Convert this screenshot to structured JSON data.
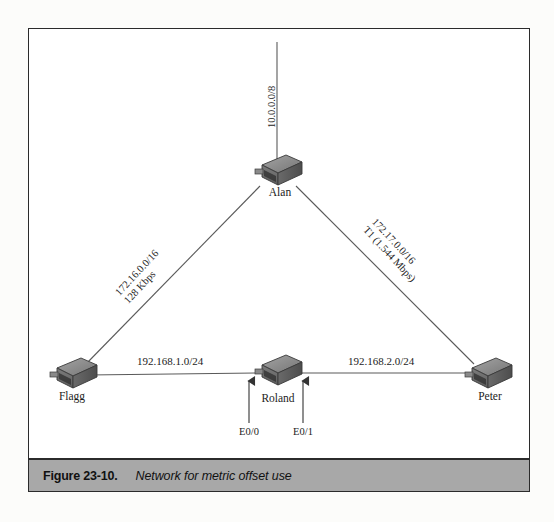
{
  "figure": {
    "caption_number": "Figure 23-10.",
    "caption_text": "Network for metric offset use"
  },
  "diagram": {
    "type": "network-topology",
    "nodes": [
      {
        "id": "alan",
        "label": "Alan",
        "role": "router",
        "x": 277,
        "y": 172
      },
      {
        "id": "flagg",
        "label": "Flagg",
        "role": "router",
        "x": 72,
        "y": 375
      },
      {
        "id": "roland",
        "label": "Roland",
        "role": "router",
        "x": 277,
        "y": 375
      },
      {
        "id": "peter",
        "label": "Peter",
        "role": "router",
        "x": 487,
        "y": 375
      }
    ],
    "links": [
      {
        "id": "alan-cloud",
        "from": "alan",
        "to": "external",
        "network": "10.0.0.0/8",
        "speed": "",
        "orientation": "vertical"
      },
      {
        "id": "alan-flagg",
        "from": "alan",
        "to": "flagg",
        "network": "172.16.0.0/16",
        "speed": "128 Kbps",
        "orientation": "diagonal-left"
      },
      {
        "id": "alan-peter",
        "from": "alan",
        "to": "peter",
        "network": "172.17.0.0/16",
        "speed": "T1 (1.544 Mbps)",
        "orientation": "diagonal-right"
      },
      {
        "id": "flagg-roland",
        "from": "flagg",
        "to": "roland",
        "network": "192.168.1.0/24",
        "speed": "",
        "orientation": "horizontal"
      },
      {
        "id": "roland-peter",
        "from": "roland",
        "to": "peter",
        "network": "192.168.2.0/24",
        "speed": "",
        "orientation": "horizontal"
      }
    ],
    "interfaces": [
      {
        "id": "e0-0",
        "label": "E0/0",
        "node": "roland",
        "side": "left"
      },
      {
        "id": "e0-1",
        "label": "E0/1",
        "node": "roland",
        "side": "right"
      }
    ]
  },
  "colors": {
    "line": "#5a5a5a",
    "frame": "#2b2b2b",
    "caption_bar": "#a8a8a8",
    "router_top": "#8e8e8e",
    "router_front": "#6e6e6e",
    "router_side": "#4a4a4a",
    "text": "#1c1c1c"
  }
}
